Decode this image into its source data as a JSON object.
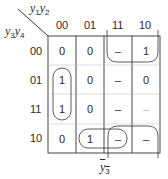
{
  "kmap": {
    "col_var_label": "y1y2",
    "row_var_label": "y3y4",
    "col_headers": [
      "00",
      "01",
      "11",
      "10"
    ],
    "row_headers": [
      "00",
      "01",
      "11",
      "10"
    ],
    "cells": [
      [
        "0",
        "0",
        "–",
        "1"
      ],
      [
        "1",
        "0",
        "–",
        "0"
      ],
      [
        "1",
        "0",
        "–",
        "–"
      ],
      [
        "0",
        "1",
        "–",
        "–"
      ]
    ],
    "groupings": [
      {
        "name": "rows-01-11-col-00",
        "cells": [
          [
            1,
            0
          ],
          [
            2,
            0
          ]
        ]
      },
      {
        "name": "top-right-wrap",
        "cells": [
          [
            0,
            2
          ],
          [
            0,
            3
          ]
        ]
      },
      {
        "name": "bottom-right-wrap",
        "cells": [
          [
            3,
            2
          ],
          [
            3,
            3
          ]
        ]
      },
      {
        "name": "row10-cols-01-11",
        "cells": [
          [
            3,
            1
          ],
          [
            3,
            2
          ]
        ]
      }
    ],
    "annotation": "y3-bar"
  }
}
